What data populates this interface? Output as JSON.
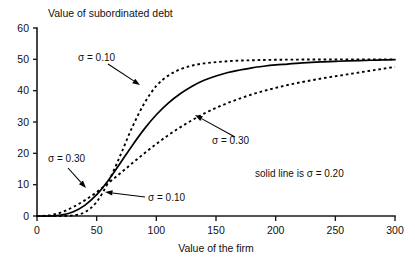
{
  "chart_data": {
    "type": "line",
    "title": "Value of subordinated debt",
    "xlabel": "Value of the firm",
    "ylabel": "",
    "xlim": [
      0,
      300
    ],
    "ylim": [
      0,
      60
    ],
    "xticks": [
      0,
      50,
      100,
      150,
      200,
      250,
      300
    ],
    "yticks": [
      0,
      10,
      20,
      30,
      40,
      50,
      60
    ],
    "grid": false,
    "legend_position": "inline-annotations",
    "legend_note": "solid line is σ = 0.20",
    "x": [
      0,
      10,
      20,
      30,
      40,
      50,
      60,
      70,
      80,
      90,
      100,
      110,
      120,
      130,
      140,
      150,
      160,
      170,
      180,
      190,
      200,
      210,
      220,
      230,
      240,
      250,
      260,
      270,
      280,
      290,
      300
    ],
    "series": [
      {
        "name": "σ = 0.10",
        "style": "dotted",
        "values": [
          0,
          0,
          0,
          0.2,
          1.2,
          4.5,
          11.0,
          19.5,
          28.5,
          36.0,
          41.5,
          44.8,
          46.8,
          48.0,
          48.7,
          49.1,
          49.4,
          49.6,
          49.7,
          49.8,
          49.85,
          49.9,
          49.92,
          49.94,
          49.96,
          49.97,
          49.98,
          49.99,
          49.99,
          50.0,
          50.0
        ]
      },
      {
        "name": "σ = 0.20",
        "style": "solid",
        "values": [
          0,
          0,
          0.3,
          1.3,
          3.4,
          6.8,
          11.5,
          17.0,
          22.6,
          27.8,
          32.3,
          36.0,
          39.0,
          41.4,
          43.3,
          44.7,
          45.8,
          46.6,
          47.3,
          47.8,
          48.2,
          48.5,
          48.8,
          49.0,
          49.2,
          49.35,
          49.5,
          49.6,
          49.7,
          49.8,
          49.9
        ]
      },
      {
        "name": "σ = 0.30",
        "style": "dotted",
        "values": [
          0,
          0.2,
          1.1,
          2.8,
          5.0,
          7.6,
          10.6,
          13.7,
          16.9,
          20.0,
          23.0,
          25.8,
          28.3,
          30.6,
          32.7,
          34.5,
          36.1,
          37.5,
          38.8,
          39.9,
          40.9,
          41.8,
          42.6,
          43.3,
          44.0,
          44.6,
          45.2,
          45.8,
          46.4,
          47.0,
          47.6
        ]
      }
    ],
    "annotations": [
      {
        "id": "sigma-010-upper",
        "label": "σ = 0.10",
        "text_x": 78,
        "text_y": 61,
        "arrow_from_x": 108,
        "arrow_from_y": 64,
        "arrow_to_x": 140,
        "arrow_to_y": 85
      },
      {
        "id": "sigma-030-right",
        "label": "σ = 0.30",
        "text_x": 212,
        "text_y": 144,
        "arrow_from_x": 235,
        "arrow_from_y": 137,
        "arrow_to_x": 195,
        "arrow_to_y": 115
      },
      {
        "id": "sigma-030-left",
        "label": "σ = 0.30",
        "text_x": 48,
        "text_y": 162,
        "arrow_from_x": 68,
        "arrow_from_y": 168,
        "arrow_to_x": 86,
        "arrow_to_y": 188
      },
      {
        "id": "sigma-010-lower",
        "label": "σ = 0.10",
        "text_x": 148,
        "text_y": 201,
        "arrow_from_x": 145,
        "arrow_from_y": 197,
        "arrow_to_x": 105,
        "arrow_to_y": 192
      }
    ],
    "legend_x": 255,
    "legend_y": 177,
    "colors": {
      "line": "#000000",
      "axis": "#1a1a1a",
      "background": "#ffffff"
    }
  }
}
